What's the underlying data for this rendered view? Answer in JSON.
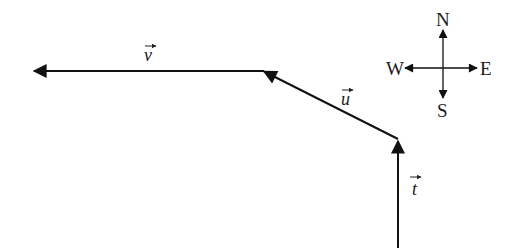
{
  "diagram": {
    "type": "vector-path",
    "color": "#111111",
    "vectors": [
      {
        "name": "t",
        "label": "t",
        "from": [
          398,
          248
        ],
        "to": [
          398,
          140
        ],
        "direction": "N"
      },
      {
        "name": "u",
        "label": "u",
        "from": [
          398,
          139
        ],
        "to": [
          263,
          71
        ],
        "direction": "NW"
      },
      {
        "name": "v",
        "label": "v",
        "from": [
          263,
          71
        ],
        "to": [
          35,
          71
        ],
        "direction": "W"
      }
    ],
    "compass": {
      "center": [
        443,
        68
      ],
      "labels": {
        "north": "N",
        "south": "S",
        "east": "E",
        "west": "W"
      }
    }
  }
}
